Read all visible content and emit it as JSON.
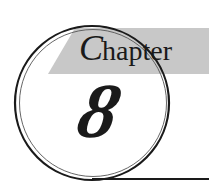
{
  "chapter_heading": {
    "label_initial": "C",
    "label_rest": "hapter",
    "number": "8"
  },
  "colors": {
    "banner": "#c8c8c8",
    "ink": "#1a1a1a",
    "background": "#ffffff"
  }
}
